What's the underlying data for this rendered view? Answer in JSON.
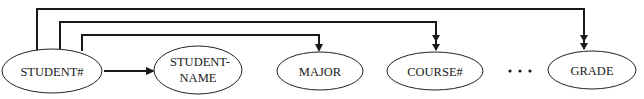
{
  "diagram": {
    "type": "functional-dependency-diagram",
    "nodes": [
      {
        "id": "student_no",
        "label_lines": [
          "STUDENT#"
        ],
        "cx": 52,
        "cy": 71,
        "rx": 50,
        "ry": 22
      },
      {
        "id": "student_name",
        "label_lines": [
          "STUDENT-",
          "NAME"
        ],
        "cx": 198,
        "cy": 70,
        "rx": 44,
        "ry": 24
      },
      {
        "id": "major",
        "label_lines": [
          "MAJOR"
        ],
        "cx": 320,
        "cy": 71,
        "rx": 43,
        "ry": 19
      },
      {
        "id": "course_no",
        "label_lines": [
          "COURSE#"
        ],
        "cx": 435,
        "cy": 71,
        "rx": 48,
        "ry": 19
      },
      {
        "id": "grade",
        "label_lines": [
          "GRADE"
        ],
        "cx": 592,
        "cy": 70,
        "rx": 44,
        "ry": 19
      }
    ],
    "edges": [
      {
        "from": "student_no",
        "to": "student_name",
        "kind": "single-valued",
        "arrowheads": 1
      },
      {
        "from": "student_no",
        "to": "major",
        "kind": "single-valued",
        "arrowheads": 1
      },
      {
        "from": "student_no",
        "to": "course_no",
        "kind": "multi-valued",
        "arrowheads": 2
      },
      {
        "from": "student_no",
        "to": "grade",
        "kind": "multi-valued",
        "arrowheads": 2
      }
    ],
    "ellipsis": "• • •",
    "colors": {
      "line": "#1a1a1a",
      "background": "#ffffff"
    }
  },
  "labels": {
    "student_no": "STUDENT#",
    "student_name_line1": "STUDENT-",
    "student_name_line2": "NAME",
    "major": "MAJOR",
    "course_no": "COURSE#",
    "grade": "GRADE",
    "ellipsis": "• • •"
  }
}
